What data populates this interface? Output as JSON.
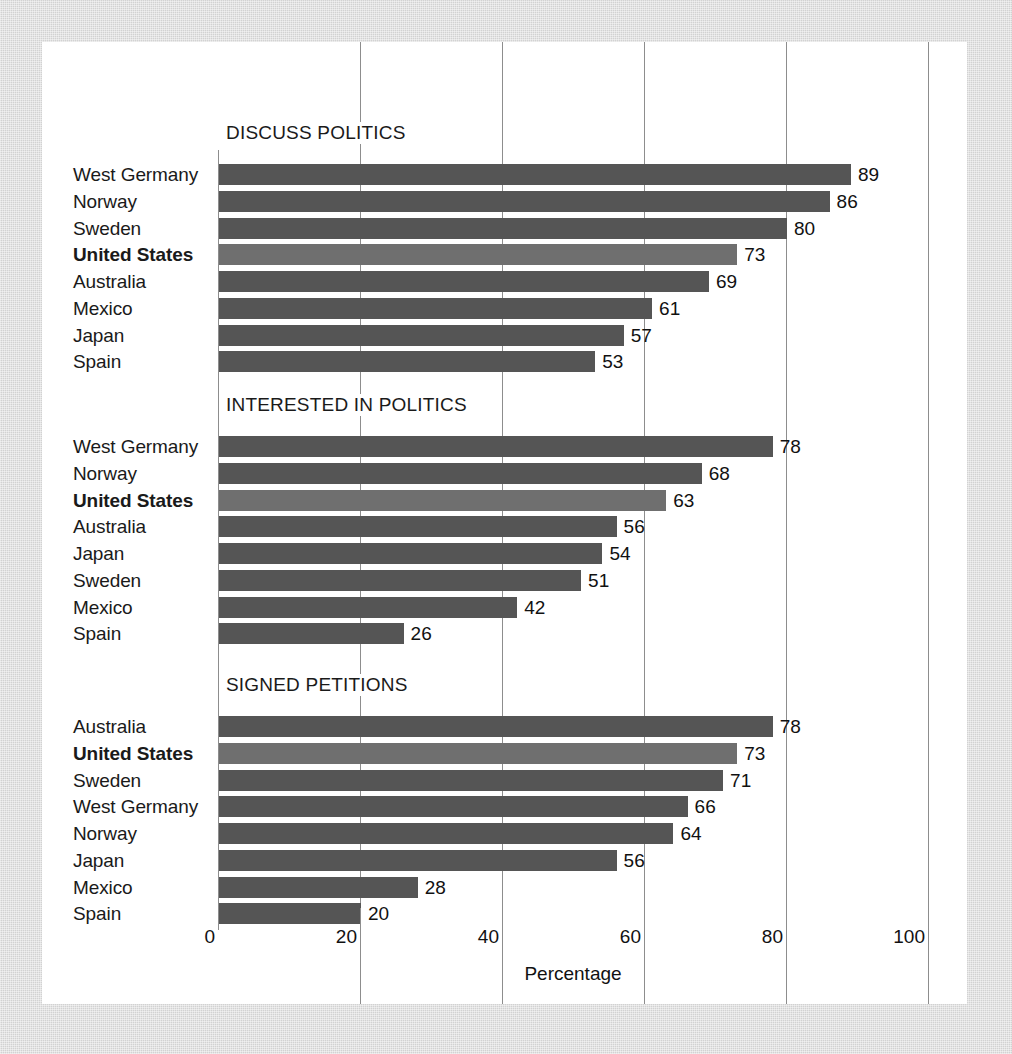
{
  "figure": {
    "x_axis_title": "Percentage",
    "tick_labels": [
      "0",
      "20",
      "40",
      "60",
      "80",
      "100"
    ],
    "bar_color": "#555555",
    "highlight_bar_color": "#6f6f6f",
    "gridline_color": "#8d8d8d",
    "card_color": "#ffffff",
    "background_color": "#d2d2d2"
  },
  "chart_data": {
    "type": "bar",
    "title": "",
    "xlabel": "Percentage",
    "ylabel": "",
    "xlim": [
      0,
      100
    ],
    "orientation": "horizontal",
    "grid": true,
    "legend": "none",
    "ticks": [
      0,
      20,
      40,
      60,
      80,
      100
    ],
    "highlight_category": "United States",
    "panels": [
      {
        "title": "DISCUSS POLITICS",
        "categories": [
          "West Germany",
          "Norway",
          "Sweden",
          "United States",
          "Australia",
          "Mexico",
          "Japan",
          "Spain"
        ],
        "values": [
          89,
          86,
          80,
          73,
          69,
          61,
          57,
          53
        ]
      },
      {
        "title": "INTERESTED IN POLITICS",
        "categories": [
          "West Germany",
          "Norway",
          "United States",
          "Australia",
          "Japan",
          "Sweden",
          "Mexico",
          "Spain"
        ],
        "values": [
          78,
          68,
          63,
          56,
          54,
          51,
          42,
          26
        ]
      },
      {
        "title": "SIGNED PETITIONS",
        "categories": [
          "Australia",
          "United States",
          "Sweden",
          "West Germany",
          "Norway",
          "Japan",
          "Mexico",
          "Spain"
        ],
        "values": [
          78,
          73,
          71,
          66,
          64,
          56,
          28,
          20
        ]
      }
    ]
  }
}
